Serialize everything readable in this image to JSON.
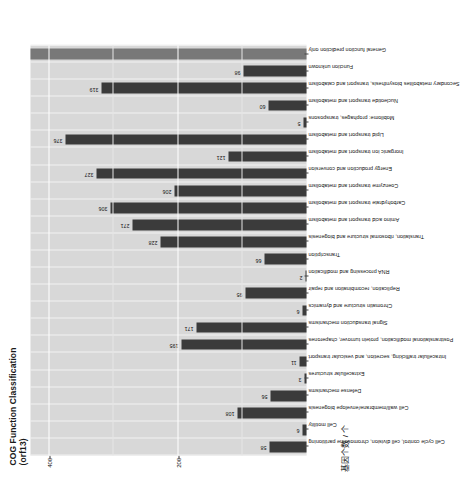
{
  "chart": {
    "title_line1": "COG Function Classification",
    "title_line2": "(orf13)",
    "y_axis_label": "基因个数 / 个",
    "y_ticks": [
      "200",
      "400"
    ],
    "y_tick_values": [
      200,
      400
    ]
  },
  "chart_data": {
    "type": "bar",
    "title": "COG Function Classification (orf13)",
    "xlabel": "",
    "ylabel": "基因个数 / 个",
    "ylim": [
      0,
      430
    ],
    "grid": true,
    "legend": "none",
    "orientation": "vertical-rotated",
    "categories": [
      "Cell cycle control, cell division, chromosome partitioning",
      "Cell motility",
      "Cell wall/membrane/envelope biogenesis",
      "Defense mechanisms",
      "Extracellular structures",
      "Intracellular trafficking, secretion, and vesicular transport",
      "Posttranslational modification, protein turnover, chaperones",
      "Signal transduction mechanisms",
      "Chromatin structure and dynamics",
      "Replication, recombination and repair",
      "RNA processing and modification",
      "Transcription",
      "Translation, ribosomal structure and biogenesis",
      "Amino acid transport and metabolism",
      "Carbohydrate transport and metabolism",
      "Coenzyme transport and metabolism",
      "Energy production and conversion",
      "Inorganic ion transport and metabolism",
      "Lipid transport and metabolism",
      "Mobilome: prophages, transposons",
      "Nucleotide transport and metabolism",
      "Secondary metabolites biosynthesis, transport and catabolism",
      "Function unknown",
      "General function prediction only"
    ],
    "values": [
      58,
      6,
      108,
      56,
      3,
      11,
      195,
      171,
      6,
      95,
      2,
      66,
      228,
      271,
      306,
      206,
      327,
      121,
      376,
      5,
      60,
      319,
      98,
      430
    ],
    "value_labels": [
      "58",
      "6",
      "108",
      "56",
      "3",
      "11",
      "195",
      "171",
      "6",
      "95",
      "2",
      "66",
      "228",
      "271",
      "306",
      "206",
      "327",
      "121",
      "376",
      "5",
      "60",
      "319",
      "98",
      ""
    ],
    "colors": {
      "bar_dark": "#3b3b3b",
      "bar_light": "#787878",
      "panel_background": "#d8d8d8",
      "grid_line": "#ffffff"
    },
    "light_bars": [
      23
    ]
  }
}
